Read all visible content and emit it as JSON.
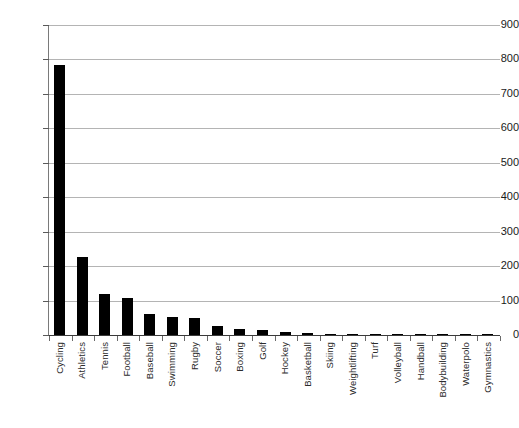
{
  "chart_data": {
    "type": "bar",
    "title": "",
    "subtitle": "",
    "xlabel": "",
    "ylabel": "",
    "ylim": [
      0,
      900
    ],
    "ytick_step": 100,
    "yticks": [
      900,
      800,
      700,
      600,
      500,
      400,
      300,
      200,
      100,
      0
    ],
    "grid": true,
    "legend": false,
    "legend_position": "none",
    "orientation": "vertical",
    "bar_color": "#000000",
    "grid_color": "#b4b4b4",
    "axis_color": "#3a3a3a",
    "categories": [
      "Cycling",
      "Athletics",
      "Tennis",
      "Football",
      "Baseball",
      "Swimming",
      "Rugby",
      "Soccer",
      "Boxing",
      "Golf",
      "Hockey",
      "Basketball",
      "Skiing",
      "Weightlifting",
      "Turf",
      "Volleyball",
      "Handball",
      "Bodybuilding",
      "Waterpolo",
      "Gymnastics"
    ],
    "values": [
      785,
      226,
      120,
      108,
      60,
      53,
      50,
      25,
      17,
      16,
      8,
      5,
      4,
      4,
      2,
      1,
      1,
      1,
      1,
      1
    ]
  }
}
